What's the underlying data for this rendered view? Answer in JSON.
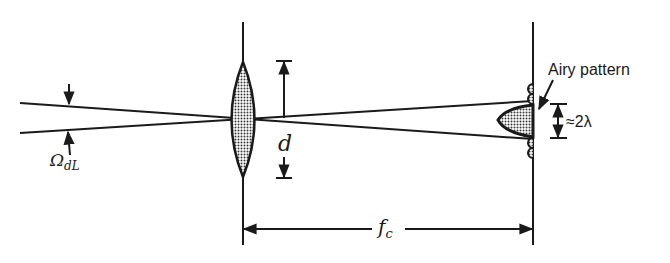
{
  "diagram": {
    "labels": {
      "solid_angle_symbol": "Ω",
      "solid_angle_subscript": "dL",
      "aperture": "d",
      "focal_length_symbol": "f",
      "focal_length_subscript": "c",
      "airy_label": "Airy pattern",
      "airy_width": "≈2λ"
    },
    "elements": [
      "incoming-beam",
      "lens",
      "lens-axis",
      "focal-screen",
      "airy-pattern",
      "aperture-dimension",
      "focal-length-dimension",
      "airy-width-dimension",
      "divergence-angle-arrows"
    ],
    "colors": {
      "ink": "#1a1a1a",
      "hatch_fill": "#9a9a9a",
      "background": "#ffffff"
    }
  }
}
